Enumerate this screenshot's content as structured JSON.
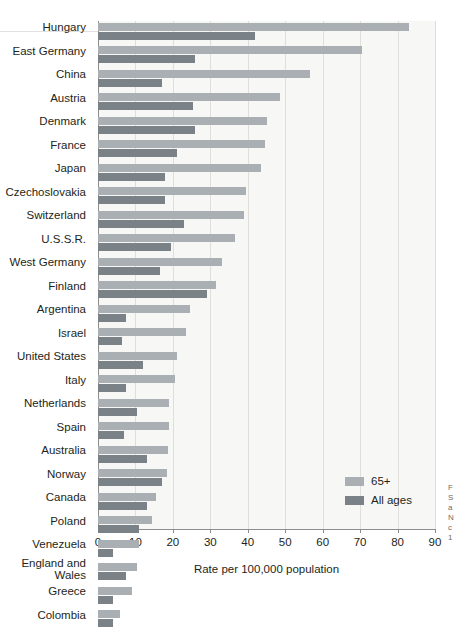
{
  "chart_data": {
    "type": "bar",
    "orientation": "horizontal",
    "title": "",
    "xlabel": "Rate per 100,000 population",
    "ylabel": "",
    "xlim": [
      0,
      90
    ],
    "xticks": [
      0,
      10,
      20,
      30,
      40,
      50,
      60,
      70,
      80,
      90
    ],
    "grid": true,
    "legend_position": "inside-bottom-right",
    "categories": [
      "Hungary",
      "East Germany",
      "China",
      "Austria",
      "Denmark",
      "France",
      "Japan",
      "Czechoslovakia",
      "Switzerland",
      "U.S.S.R.",
      "West Germany",
      "Finland",
      "Argentina",
      "Israel",
      "United States",
      "Italy",
      "Netherlands",
      "Spain",
      "Australia",
      "Norway",
      "Canada",
      "Poland",
      "Venezuela",
      "England and\nWales",
      "Greece",
      "Colombia"
    ],
    "series": [
      {
        "name": "65+",
        "color": "#a9afb3",
        "values": [
          83.0,
          70.5,
          56.5,
          48.5,
          45.0,
          44.5,
          43.5,
          39.5,
          39.0,
          36.5,
          33.0,
          31.5,
          24.5,
          23.5,
          21.0,
          20.5,
          19.0,
          19.0,
          18.8,
          18.5,
          15.5,
          14.5,
          11.0,
          10.5,
          9.0,
          6.0
        ]
      },
      {
        "name": "All ages",
        "color": "#7b8287",
        "values": [
          42.0,
          26.0,
          17.0,
          25.5,
          26.0,
          21.0,
          18.0,
          18.0,
          23.0,
          19.5,
          16.5,
          29.0,
          7.5,
          6.5,
          12.0,
          7.5,
          10.5,
          7.0,
          13.0,
          17.0,
          13.0,
          11.0,
          4.0,
          7.5,
          4.0,
          4.0
        ]
      }
    ]
  },
  "axis": {
    "tick_labels": [
      "0",
      "10",
      "20",
      "30",
      "40",
      "50",
      "60",
      "70",
      "80",
      "90"
    ],
    "x_title": "Rate per 100,000 population"
  },
  "legend": {
    "items": [
      {
        "label": "65+",
        "color": "#a9afb3"
      },
      {
        "label": "All ages",
        "color": "#7b8287"
      }
    ]
  },
  "margin_caption": "F\nS\na\nN\nc\n1"
}
